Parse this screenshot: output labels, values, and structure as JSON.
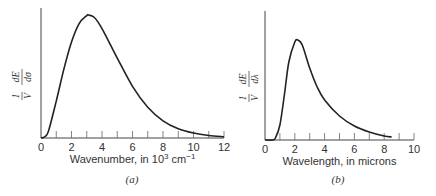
{
  "chart_data": [
    {
      "type": "line",
      "panel_label": "(a)",
      "xlabel": "Wavenumber, in 10³ cm⁻¹",
      "xlabel_parts": {
        "pre": "Wavenumber, in 10",
        "sup1": "3",
        "mid": " cm",
        "sup2": "−1"
      },
      "ylabel": "1/V dE/dσ",
      "ylabel_parts": {
        "num1": "1",
        "den1": "V",
        "num2": "dE",
        "den2": "dσ"
      },
      "xlim": [
        0,
        12
      ],
      "tick_labels": [
        "0",
        "2",
        "4",
        "6",
        "8",
        "10",
        "12"
      ],
      "minor_ticks_every": 1,
      "grid": false,
      "peak": {
        "x": 3.1,
        "y": 1.0
      },
      "x": [
        0,
        0.25,
        0.5,
        1,
        1.5,
        2,
        2.5,
        3,
        3.1,
        3.5,
        4,
        5,
        6,
        7,
        8,
        9,
        10,
        11,
        12
      ],
      "y": [
        0,
        0.01,
        0.06,
        0.3,
        0.56,
        0.78,
        0.93,
        0.995,
        1.0,
        0.98,
        0.89,
        0.65,
        0.42,
        0.25,
        0.14,
        0.075,
        0.04,
        0.02,
        0.01
      ]
    },
    {
      "type": "line",
      "panel_label": "(b)",
      "xlabel": "Wavelength, in microns",
      "ylabel": "1/V dE/dλ",
      "ylabel_parts": {
        "num1": "1",
        "den1": "V",
        "num2": "dE",
        "den2": "dλ"
      },
      "xlim": [
        0,
        10
      ],
      "tick_labels": [
        "0",
        "2",
        "4",
        "6",
        "8",
        "10"
      ],
      "minor_ticks_every": 1,
      "grid": false,
      "peak": {
        "x": 2.2,
        "y": 1.0
      },
      "x": [
        0,
        0.5,
        0.7,
        1,
        1.3,
        1.6,
        2,
        2.2,
        2.5,
        3,
        3.5,
        4,
        5,
        6,
        7,
        8,
        8.5
      ],
      "y": [
        0,
        0,
        0.02,
        0.15,
        0.45,
        0.78,
        0.98,
        1.0,
        0.95,
        0.72,
        0.53,
        0.4,
        0.24,
        0.14,
        0.08,
        0.04,
        0.03
      ]
    }
  ]
}
